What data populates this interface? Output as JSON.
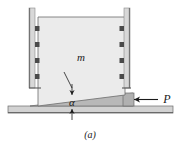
{
  "figure": {
    "caption": "(a)",
    "mass_label": "m",
    "angle_label": "α",
    "force_label": "P",
    "parts": {
      "block_name": "block of mass m",
      "wedge_name": "wedge",
      "ground_name": "ground surface",
      "left_rail_name": "left vertical guide rail",
      "right_rail_name": "right vertical guide rail",
      "force_arrow_name": "applied force P arrow",
      "angle_dimension_name": "wedge angle alpha dimension"
    },
    "colors": {
      "block_fill": "#ebebeb",
      "wedge_fill": "#b8b8b8",
      "ground_fill": "#d2d2d2",
      "rail_fill": "#d8d8d8",
      "bearing_fill": "#4a4a4a",
      "outline": "#6b6b6b",
      "ink": "#1a1a1a",
      "background": "#ffffff"
    },
    "geometry": {
      "bearing_count_per_rail": 4,
      "rail_top_y": 8,
      "block_top_y": 17,
      "ground_line_y": 112
    }
  }
}
